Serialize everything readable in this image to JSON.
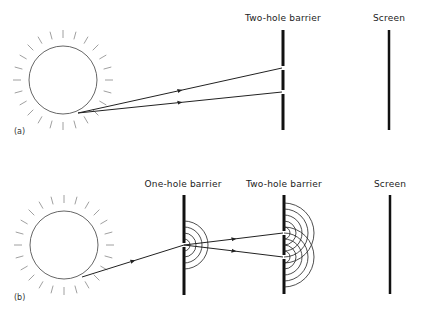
{
  "panels": {
    "a": {
      "tag": "(a)",
      "labels": {
        "two_hole_barrier": "Two-hole barrier",
        "screen": "Screen"
      }
    },
    "b": {
      "tag": "(b)",
      "labels": {
        "one_hole_barrier": "One-hole barrier",
        "two_hole_barrier": "Two-hole barrier",
        "screen": "Screen"
      }
    }
  },
  "colors": {
    "ink": "#222222",
    "sun_outline": "#555555",
    "rays": "#888888",
    "background": "#ffffff"
  }
}
